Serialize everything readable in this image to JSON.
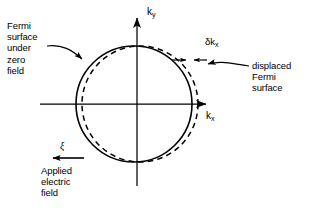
{
  "figure": {
    "width": 322,
    "height": 217,
    "background_color": "#ffffff",
    "stroke_color": "#000000"
  },
  "axes": {
    "x_label": "k",
    "x_subscript": "x",
    "y_label": "k",
    "y_subscript": "y",
    "origin_px": [
      137,
      104
    ],
    "x_axis_from_px": [
      40,
      104
    ],
    "x_axis_to_px": [
      212,
      104
    ],
    "y_axis_from_px": [
      137,
      186
    ],
    "y_axis_to_px": [
      137,
      14
    ],
    "arrowheads": [
      "x-positive",
      "y-positive"
    ]
  },
  "annotations": {
    "fermi_zero_field": {
      "lines": [
        "Fermi",
        "surface",
        "under",
        "zero",
        "field"
      ],
      "leader": "curved-arrow-to-solid-circle-upper-left"
    },
    "displaced_fermi": {
      "lines": [
        "displaced",
        "Fermi",
        "surface"
      ],
      "leader": "curved-arrow-to-dashed-circle-upper-right"
    },
    "applied_field": {
      "lines": [
        "Applied",
        "electric",
        "field"
      ],
      "symbol": "ξ",
      "arrow_direction": "left"
    },
    "displacement": {
      "label": "δk",
      "subscript": "x",
      "marker": "double-ended-arrow-between-circles"
    }
  },
  "chart_data": {
    "type": "scatter",
    "shapes": [
      {
        "name": "fermi-surface-zero-field",
        "kind": "circle",
        "style": "solid",
        "center_px": [
          134,
          104
        ],
        "radius_px": 58
      },
      {
        "name": "displaced-fermi-surface",
        "kind": "circle",
        "style": "dashed",
        "center_px": [
          140,
          104
        ],
        "radius_px": 58
      }
    ],
    "displacement_delta_kx_px": 6,
    "xlabel": "k_x",
    "ylabel": "k_y",
    "grid": false,
    "legend": "inline-annotations"
  }
}
